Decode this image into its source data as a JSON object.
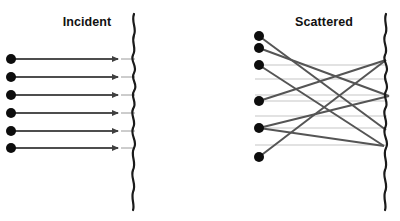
{
  "figure": {
    "width": 400,
    "height": 221,
    "background": "#ffffff"
  },
  "colors": {
    "surface_line": "#1a1a1a",
    "ray_dark": "#4d4d4d",
    "ray_mid": "#555555",
    "dot": "#0d0d0d",
    "guide_line": "#e2e2e2",
    "title_text": "#111111"
  },
  "panels": [
    {
      "id": "incident",
      "title": "Incident",
      "title_x": 87,
      "title_y": 26,
      "surface_x": 135,
      "rays": [
        {
          "label": "ray-1",
          "y": 59,
          "dot_x": 11,
          "arrow_x": 121,
          "tail_x": 135
        },
        {
          "label": "ray-2",
          "y": 77,
          "dot_x": 11,
          "arrow_x": 121,
          "tail_x": 135
        },
        {
          "label": "ray-3",
          "y": 95,
          "dot_x": 11,
          "arrow_x": 121,
          "tail_x": 135
        },
        {
          "label": "ray-4",
          "y": 113,
          "dot_x": 11,
          "arrow_x": 121,
          "tail_x": 135
        },
        {
          "label": "ray-5",
          "y": 131,
          "dot_x": 11,
          "arrow_x": 121,
          "tail_x": 135
        },
        {
          "label": "ray-6",
          "y": 148,
          "dot_x": 11,
          "arrow_x": 121,
          "tail_x": 135
        }
      ]
    },
    {
      "id": "scattered",
      "title": "Scattered",
      "title_x": 324,
      "title_y": 26,
      "surface_x": 385,
      "dots": [
        {
          "label": "dot-1",
          "x": 259,
          "y": 36
        },
        {
          "label": "dot-2",
          "x": 259,
          "y": 48
        },
        {
          "label": "dot-3",
          "x": 259,
          "y": 65
        },
        {
          "label": "dot-4",
          "x": 259,
          "y": 101
        },
        {
          "label": "dot-5",
          "x": 259,
          "y": 128
        },
        {
          "label": "dot-6",
          "x": 259,
          "y": 157
        }
      ],
      "guide_lines_y": [
        65,
        79,
        95,
        101,
        116,
        128,
        145
      ],
      "guide_x1": 255,
      "guide_x2": 387,
      "scatter_rays": [
        {
          "label": "scatter-1",
          "x1": 259,
          "y1": 36,
          "x2": 386,
          "y2": 130
        },
        {
          "label": "scatter-2",
          "x1": 259,
          "y1": 48,
          "x2": 389,
          "y2": 96
        },
        {
          "label": "scatter-3",
          "x1": 259,
          "y1": 65,
          "x2": 384,
          "y2": 146
        },
        {
          "label": "scatter-4",
          "x1": 259,
          "y1": 101,
          "x2": 386,
          "y2": 60
        },
        {
          "label": "scatter-5",
          "x1": 259,
          "y1": 128,
          "x2": 389,
          "y2": 96
        },
        {
          "label": "scatter-6",
          "x1": 259,
          "y1": 157,
          "x2": 386,
          "y2": 60
        },
        {
          "label": "scatter-7",
          "x1": 259,
          "y1": 128,
          "x2": 384,
          "y2": 146
        }
      ]
    }
  ],
  "surface_path_left": "M134,14 C131,22 137,28 134,35 C131,43 137,48 133,55 C130,62 138,66 134,73 C130,80 139,84 134,91 C130,98 138,102 133,109 C130,116 137,121 133,128 C130,136 138,141 134,148 C130,156 137,162 133,170 C130,178 137,184 133,192 C131,199 135,205 133,210",
  "surface_path_right": "M386,14 C383,22 389,28 385,35 C382,43 389,48 385,55 C382,62 390,66 386,73 C382,80 390,84 386,91 C382,98 390,102 385,109 C382,116 389,121 385,128 C382,136 390,141 386,148 C382,156 389,162 385,170 C382,178 389,184 385,192 C383,199 387,205 385,210"
}
